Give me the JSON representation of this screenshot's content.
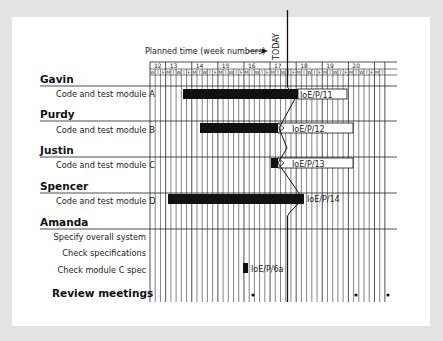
{
  "chart_data": {
    "type": "gantt",
    "title": "",
    "x_axis": {
      "label": "Planned time (week numbers)",
      "weeks": [
        {
          "week": "12",
          "days": [
            "W",
            "T",
            "F"
          ]
        },
        {
          "week": "13",
          "days": [
            "M",
            "T",
            "W",
            "T",
            "F"
          ]
        },
        {
          "week": "14",
          "days": [
            "M",
            "T",
            "W",
            "T",
            "F"
          ]
        },
        {
          "week": "15",
          "days": [
            "M",
            "T",
            "W",
            "T",
            "F"
          ]
        },
        {
          "week": "16",
          "days": [
            "M",
            "T",
            "W",
            "T",
            "F"
          ]
        },
        {
          "week": "17",
          "days": [
            "M",
            "T",
            "W",
            "T",
            "F"
          ]
        },
        {
          "week": "18",
          "days": [
            "M",
            "T",
            "W",
            "T",
            "F"
          ]
        },
        {
          "week": "19",
          "days": [
            "M",
            "T",
            "W",
            "T",
            "F"
          ]
        },
        {
          "week": "20",
          "days": [
            "M",
            "T",
            "W",
            "T",
            "F"
          ]
        },
        {
          "week": "",
          "days": [
            "M",
            "T"
          ]
        }
      ]
    },
    "today_marker": {
      "label": "TODAY",
      "day_index": 25
    },
    "groups": [
      {
        "person": "Gavin",
        "tasks": [
          {
            "name": "Code and test module A",
            "start_day": 6,
            "done_end_day": 28,
            "end_day": 38,
            "ref": "IoE/P/11"
          }
        ]
      },
      {
        "person": "Purdy",
        "tasks": [
          {
            "name": "Code and test module B",
            "start_day": 9,
            "done_end_day": 24,
            "end_day": 39,
            "ref": "IoE/P/12"
          }
        ]
      },
      {
        "person": "Justin",
        "tasks": [
          {
            "name": "Code and test module C",
            "start_day": 23,
            "done_end_day": 24,
            "end_day": 39,
            "ref": "IoE/P/13"
          }
        ]
      },
      {
        "person": "Spencer",
        "tasks": [
          {
            "name": "Code and test module D",
            "start_day": 3,
            "done_end_day": 29,
            "end_day": 29,
            "ref": "IoE/P/14"
          }
        ]
      },
      {
        "person": "Amanda",
        "tasks": [
          {
            "name": "Specify overall system"
          },
          {
            "name": "Check specifications"
          },
          {
            "name": "Check module C spec",
            "start_day": 18,
            "done_end_day": 19,
            "end_day": 19,
            "ref": "IoE/P/6a"
          }
        ]
      }
    ],
    "milestones": {
      "name": "Review meetings",
      "day_indexes": [
        19,
        39,
        45
      ]
    },
    "legend": {
      "planned_time_label": "Planned time (week numbers)",
      "arrow": "→"
    }
  },
  "labels": {
    "planned_time": "Planned time (week numbers)",
    "today": "TODAY",
    "persons": [
      "Gavin",
      "Purdy",
      "Justin",
      "Spencer",
      "Amanda"
    ],
    "tasks": {
      "a": "Code and test module A",
      "b": "Code and test module B",
      "c": "Code and test module C",
      "d": "Code and test module D",
      "spec1": "Specify overall system",
      "spec2": "Check specifications",
      "spec3": "Check module C spec"
    },
    "review": "Review meetings",
    "refs": {
      "a": "IoE/P/11",
      "b": "IoE/P/12",
      "c": "IoE/P/13",
      "d": "IoE/P/14",
      "e": "IoE/P/6a"
    },
    "weeks": [
      "12",
      "13",
      "14",
      "15",
      "16",
      "17",
      "18",
      "19",
      "20"
    ]
  },
  "colors": {
    "background": "#e3e3e3",
    "panel": "#ffffff",
    "ink": "#111111",
    "bar_done": "#111111",
    "bar_remaining": "#ffffff"
  }
}
